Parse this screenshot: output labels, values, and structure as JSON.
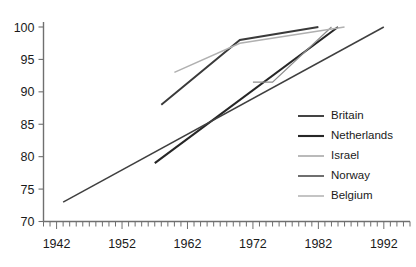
{
  "chart_data": {
    "type": "line",
    "title": "",
    "subtitle": "",
    "xlabel": "",
    "ylabel": "",
    "xlim": [
      1940,
      1996
    ],
    "ylim": [
      70,
      100
    ],
    "grid": false,
    "legend_position": "center-right",
    "x_ticks": [
      1942,
      1952,
      1962,
      1972,
      1982,
      1992
    ],
    "x_tick_labels": [
      "1942",
      "1952",
      "1962",
      "1972",
      "1982",
      "1992"
    ],
    "x_minor_tick_interval": 1,
    "y_ticks": [
      70,
      75,
      80,
      85,
      90,
      95,
      100
    ],
    "y_tick_labels": [
      "70",
      "75",
      "80",
      "85",
      "90",
      "95",
      "100"
    ],
    "series": [
      {
        "name": "Britain",
        "color": "#3a3a3a",
        "width": 1.9,
        "x": [
          1958,
          1970,
          1982
        ],
        "values": [
          88.0,
          98.0,
          100.0
        ]
      },
      {
        "name": "Netherlands",
        "color": "#262626",
        "width": 2.1,
        "x": [
          1957,
          1985
        ],
        "values": [
          79.0,
          100.0
        ]
      },
      {
        "name": "Israel",
        "color": "#8c8c8c",
        "width": 1.2,
        "x": [
          1972,
          1975,
          1984
        ],
        "values": [
          91.5,
          91.5,
          100.0
        ]
      },
      {
        "name": "Norway",
        "color": "#3f3f3f",
        "width": 1.5,
        "x": [
          1943,
          1992
        ],
        "values": [
          73.0,
          100.0
        ]
      },
      {
        "name": "Belgium",
        "color": "#b0b0b0",
        "width": 1.5,
        "x": [
          1960,
          1970,
          1986
        ],
        "values": [
          93.0,
          97.5,
          100.0
        ]
      }
    ],
    "legend_entries": [
      {
        "label": "Britain",
        "color": "#3a3a3a",
        "width": 1.9
      },
      {
        "label": "Netherlands",
        "color": "#262626",
        "width": 2.1
      },
      {
        "label": "Israel",
        "color": "#8c8c8c",
        "width": 1.2
      },
      {
        "label": "Norway",
        "color": "#3f3f3f",
        "width": 1.5
      },
      {
        "label": "Belgium",
        "color": "#b0b0b0",
        "width": 1.5
      }
    ]
  }
}
